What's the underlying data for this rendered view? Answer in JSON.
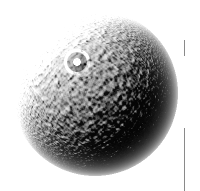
{
  "figure": {
    "caption": "Grayscale image of a textured spherical body with a ring-shaped crater in the upper-left quadrant",
    "width": 200,
    "height": 191,
    "background_color": "#ffffff"
  },
  "sphere": {
    "label": "textured sphere",
    "center_x": 95,
    "center_y": 93,
    "radius": 83,
    "bounds": {
      "left": 13,
      "top": 10,
      "right": 178,
      "bottom": 176
    },
    "surface": "granular pitted texture",
    "illumination": "upper-left",
    "highlight_color": "#f2f2f2",
    "midtone_color": "#9a9a9a",
    "shadow_color": "#2f2f2f",
    "limb_color": "#e8e8e8"
  },
  "crater": {
    "label": "ring crater",
    "center_x": 77,
    "center_y": 62,
    "outer_radius": 13,
    "inner_radius": 7,
    "peak_radius": 3,
    "rim_color": "#e0e0e0",
    "floor_color": "#6b6b6b",
    "peak_color": "#cfcfcf"
  },
  "scale_bar": {
    "label": "scale bar tick marks",
    "color": "#8a8a8a",
    "ticks": [
      {
        "name": "upper-tick",
        "x": 184,
        "y": 40,
        "length": 16
      },
      {
        "name": "lower-tick",
        "x": 184,
        "y": 128,
        "length": 63
      }
    ]
  }
}
